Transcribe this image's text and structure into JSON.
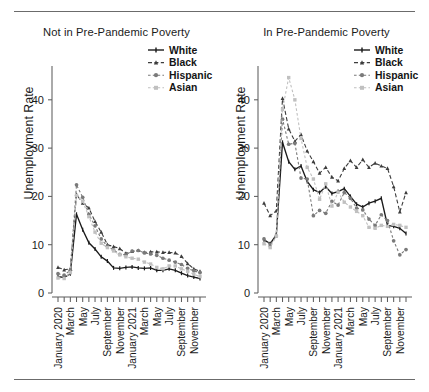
{
  "figure": {
    "rules": [
      "top-rule",
      "bottom-rule"
    ]
  },
  "panels": [
    {
      "id": "not-in-poverty",
      "title": "Not in Pre-Pandemic Poverty",
      "ylabel": "Unemployment Rate"
    },
    {
      "id": "in-poverty",
      "title": "In Pre-Pandemic Poverty",
      "ylabel": "Unemployment Rate"
    }
  ],
  "legend": {
    "entries": [
      {
        "label": "White",
        "color": "#1a1a1a",
        "dash": "none",
        "marker": "dash-tick"
      },
      {
        "label": "Black",
        "color": "#3d3d3d",
        "dash": "dashed",
        "marker": "triangle"
      },
      {
        "label": "Hispanic",
        "color": "#7a7a7a",
        "dash": "dotted",
        "marker": "circle"
      },
      {
        "label": "Asian",
        "color": "#c0c0c0",
        "dash": "dotted",
        "marker": "square"
      }
    ]
  },
  "axes": {
    "ytick_labels": [
      "0",
      "10",
      "20",
      "30",
      "40"
    ],
    "ytick_values": [
      0,
      10,
      20,
      30,
      40
    ],
    "ylim": [
      0,
      47
    ],
    "xtick_labels": [
      "January 2020",
      "March",
      "May",
      "July",
      "September",
      "November",
      "January 2021",
      "March",
      "May",
      "July",
      "September",
      "November"
    ]
  },
  "chart_data": {
    "type": "line",
    "xlabel": "",
    "ylabel": "Unemployment Rate",
    "ylim": [
      0,
      47
    ],
    "grid": false,
    "legend_position": "top-right",
    "x": [
      "January 2020",
      "February 2020",
      "March 2020",
      "April 2020",
      "May 2020",
      "June 2020",
      "July 2020",
      "August 2020",
      "September 2020",
      "October 2020",
      "November 2020",
      "December 2020",
      "January 2021",
      "February 2021",
      "March 2021",
      "April 2021",
      "May 2021",
      "June 2021",
      "July 2021",
      "August 2021",
      "September 2021",
      "October 2021",
      "November 2021",
      "December 2021"
    ],
    "xtick_labels": [
      "January 2020",
      "March",
      "May",
      "July",
      "September",
      "November",
      "January 2021",
      "March",
      "May",
      "July",
      "September",
      "November"
    ],
    "panels": [
      {
        "title": "Not in Pre-Pandemic Poverty",
        "series": [
          {
            "name": "White",
            "values": [
              3.4,
              3.2,
              4.0,
              16.3,
              13.1,
              10.4,
              9.1,
              7.5,
              6.6,
              5.2,
              5.1,
              5.3,
              5.4,
              5.2,
              5.1,
              5.2,
              4.7,
              4.7,
              5.0,
              4.7,
              4.1,
              3.6,
              3.3,
              3.0
            ]
          },
          {
            "name": "Black",
            "values": [
              5.3,
              4.8,
              5.0,
              20.4,
              18.6,
              17.6,
              14.8,
              12.6,
              10.0,
              9.6,
              9.2,
              8.2,
              8.6,
              8.8,
              8.4,
              8.5,
              8.5,
              8.4,
              8.4,
              8.3,
              7.6,
              6.1,
              5.0,
              4.5
            ]
          },
          {
            "name": "Hispanic",
            "values": [
              4.0,
              3.7,
              4.7,
              22.4,
              19.8,
              16.3,
              13.9,
              11.2,
              9.7,
              8.9,
              8.0,
              7.9,
              8.7,
              8.8,
              8.3,
              8.1,
              7.8,
              7.2,
              6.8,
              6.4,
              5.9,
              5.1,
              4.6,
              4.2
            ]
          },
          {
            "name": "Asian",
            "values": [
              3.1,
              3.0,
              4.2,
              20.2,
              19.0,
              15.8,
              12.6,
              10.3,
              9.4,
              8.7,
              7.9,
              7.5,
              7.2,
              7.0,
              6.4,
              6.0,
              5.3,
              5.0,
              5.6,
              5.6,
              5.0,
              4.5,
              3.9,
              3.4
            ]
          }
        ]
      },
      {
        "title": "In Pre-Pandemic Poverty",
        "series": [
          {
            "name": "White",
            "values": [
              11.0,
              10.2,
              12.0,
              31.2,
              27.2,
              25.6,
              26.3,
              23.1,
              21.4,
              20.8,
              22.0,
              20.6,
              21.0,
              21.6,
              20.0,
              18.4,
              17.8,
              18.6,
              19.0,
              19.6,
              14.0,
              13.8,
              13.4,
              12.3
            ]
          },
          {
            "name": "Black",
            "values": [
              18.6,
              16.0,
              17.0,
              40.3,
              34.0,
              31.4,
              32.8,
              29.4,
              27.2,
              24.8,
              26.0,
              24.0,
              23.2,
              25.8,
              27.4,
              26.0,
              27.6,
              26.0,
              26.9,
              26.3,
              25.8,
              22.0,
              16.8,
              20.8
            ]
          },
          {
            "name": "Hispanic",
            "values": [
              11.2,
              10.0,
              11.8,
              36.0,
              30.8,
              31.0,
              23.8,
              23.6,
              16.0,
              17.1,
              16.5,
              19.0,
              18.2,
              20.8,
              19.6,
              17.6,
              17.2,
              15.3,
              14.0,
              16.2,
              15.0,
              10.8,
              7.9,
              9.0
            ]
          },
          {
            "name": "Asian",
            "values": [
              10.2,
              9.4,
              11.8,
              38.0,
              44.6,
              40.0,
              32.0,
              26.0,
              23.6,
              19.4,
              22.6,
              18.0,
              20.9,
              18.8,
              17.8,
              16.9,
              16.0,
              13.6,
              13.4,
              14.0,
              13.8,
              14.2,
              14.0,
              13.6
            ]
          }
        ]
      }
    ]
  }
}
